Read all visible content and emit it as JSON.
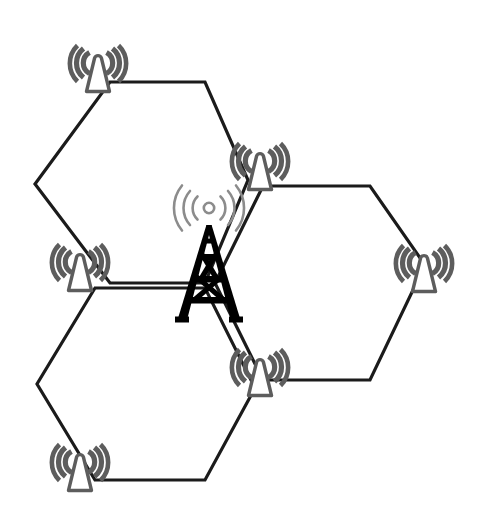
{
  "diagram": {
    "title": "Cellular Network Coverage Diagram",
    "description": "Three adjacent hexagonal cells with base-station antennas at the cell vertices and a central transmission tower.",
    "canvas": {
      "width": 481,
      "height": 529,
      "background": "#ffffff"
    },
    "colors": {
      "cell_outline": "#1b1b1b",
      "antenna_gray": "#5d5d5d",
      "antenna_fill": "#ffffff",
      "tower_black": "#000000",
      "tower_wave_gray": "#8c8c8c"
    },
    "cells": [
      {
        "id": "cell-top-left",
        "label": "Top-left hexagonal cell",
        "points": "110,82 205,82 248,180 205,283 110,283 35,184"
      },
      {
        "id": "cell-right",
        "label": "Right hexagonal cell",
        "points": "263,186 370,186 425,265 370,380 263,380 215,283"
      },
      {
        "id": "cell-bottom-left",
        "label": "Bottom-left hexagonal cell",
        "points": "95,288 205,288 255,388 205,480 95,480 37,384"
      }
    ],
    "antennas": [
      {
        "id": "antenna-top-left",
        "label": "Base station antenna — top left",
        "x": 98,
        "y": 66,
        "scale": 1.0
      },
      {
        "id": "antenna-upper-right",
        "label": "Base station antenna — upper middle right",
        "x": 260,
        "y": 164,
        "scale": 1.0
      },
      {
        "id": "antenna-left-middle",
        "label": "Base station antenna — left middle",
        "x": 80,
        "y": 265,
        "scale": 1.0
      },
      {
        "id": "antenna-far-right",
        "label": "Base station antenna — far right",
        "x": 424,
        "y": 266,
        "scale": 1.0
      },
      {
        "id": "antenna-lower-right",
        "label": "Base station antenna — lower middle right",
        "x": 260,
        "y": 370,
        "scale": 1.0
      },
      {
        "id": "antenna-bottom-left",
        "label": "Base station antenna — bottom left",
        "x": 80,
        "y": 465,
        "scale": 1.0
      }
    ],
    "tower": {
      "id": "central-transmission-tower",
      "label": "Central transmission tower",
      "x": 209,
      "y": 272,
      "wave_arcs_per_side": 3,
      "has_center_dot": true
    },
    "legend": {
      "antenna_name": "cell-antenna-icon",
      "tower_name": "transmission-tower-icon",
      "hexagon_name": "hexagonal-cell"
    },
    "counts": {
      "cells": 3,
      "antennas": 6,
      "towers": 1
    }
  }
}
